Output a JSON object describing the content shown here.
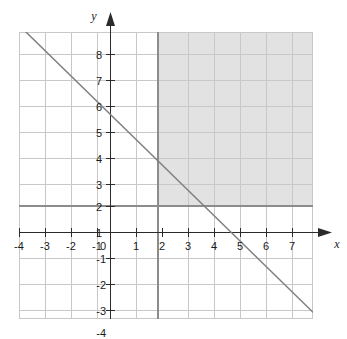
{
  "chart_data": {
    "type": "line",
    "title": "",
    "xlabel": "x",
    "ylabel": "y",
    "grid": true,
    "legend": "none",
    "xlim": [
      -4,
      8.7
    ],
    "ylim": [
      -4,
      8.7
    ],
    "x_ticks": [
      "-4",
      "-3",
      "-2",
      "-1",
      "1",
      "2",
      "3",
      "4",
      "5",
      "6",
      "7",
      "8"
    ],
    "y_ticks": [
      "8",
      "7",
      "6",
      "5",
      "4",
      "3",
      "2",
      "1",
      "-1",
      "-2",
      "-3",
      "-4"
    ],
    "origin_label": "0",
    "series": [
      {
        "name": "x + y = 5",
        "type": "line",
        "equation": "y = -x + 5",
        "slope": -1,
        "y_intercept": 5,
        "x_intercept": 5,
        "style": "solid",
        "color": "#808080",
        "points": [
          {
            "x": -3.5,
            "y": 8.5
          },
          {
            "x": 0,
            "y": 5
          },
          {
            "x": 5,
            "y": 0
          },
          {
            "x": 8.7,
            "y": -3.7
          }
        ]
      }
    ],
    "shaded_regions": [
      {
        "name": "solution-region",
        "description": "x >= 2 and y >= 1",
        "x_min": 2,
        "y_min": 1,
        "x_max": 8.7,
        "y_max": 8.7,
        "fill": "#e2e2e2",
        "boundary_x": 2,
        "boundary_y": 1
      }
    ],
    "colors": {
      "grid_minor": "#c8c8c8",
      "grid_major": "#9a9a9a",
      "axis": "#2b2b2b",
      "shade_fill": "#e2e2e2",
      "line": "#7d7d7d",
      "text": "#1a1a1a"
    },
    "axis_arrows": {
      "x": "right",
      "y": "up"
    }
  }
}
